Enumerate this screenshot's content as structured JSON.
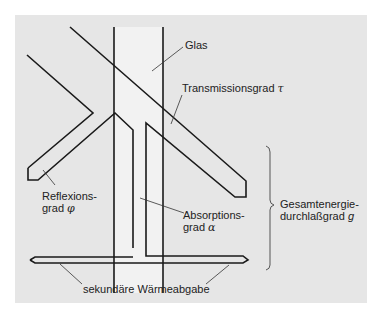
{
  "diagram": {
    "colors": {
      "background": "#e6e6e6",
      "glass": "#f2f2f2",
      "stroke": "#1a1a1a",
      "leader": "#333333",
      "bracket": "#555555"
    },
    "labels": {
      "glas": "Glas",
      "transmission": "Transmissionsgrad",
      "transmission_symbol": "τ",
      "reflection_line1": "Reflexions-",
      "reflection_line2": "grad",
      "reflection_symbol": "φ",
      "absorption_line1": "Absorptions-",
      "absorption_line2": "grad",
      "absorption_symbol": "α",
      "total_line1": "Gesamtenergie-",
      "total_line2": "durchlaßgrad",
      "total_symbol": "g",
      "secondary": "sekundäre Wärmeabgabe"
    }
  }
}
